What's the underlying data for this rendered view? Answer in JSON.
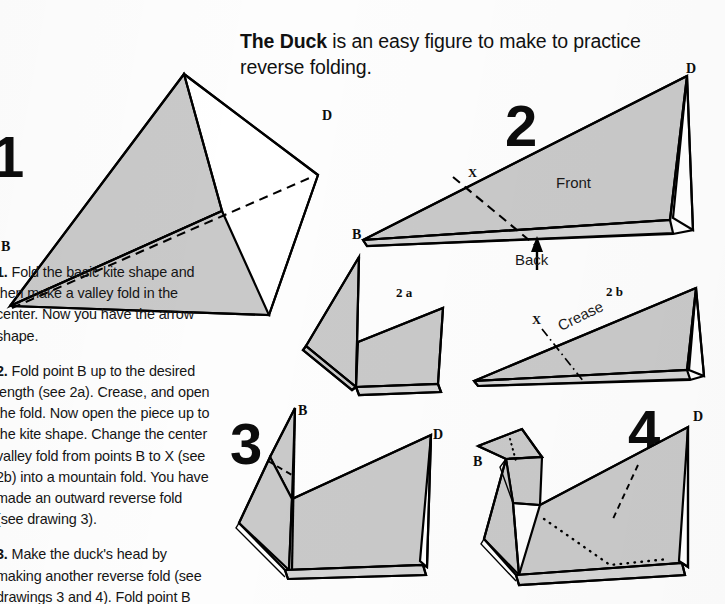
{
  "headline": {
    "bold_part": "The Duck",
    "rest": " is an easy figure to make to practice reverse folding."
  },
  "instructions": [
    {
      "number": "1.",
      "text": " Fold the basic kite shape and then make a valley fold in the center. Now you have the arrow shape."
    },
    {
      "number": "2.",
      "text": " Fold point B up to the desired length (see 2a). Crease, and open the fold. Now open the piece up to the kite shape. Change the center valley fold from points B to X (see 2b) into a mountain fold. You have made an outward reverse fold (see drawing 3)."
    },
    {
      "number": "3.",
      "text": " Make the duck's head by making another reverse fold (see drawings 3 and 4). Fold point B"
    }
  ],
  "figures": {
    "fig1": {
      "number": "1",
      "labels": {
        "b": "B",
        "d": "D"
      }
    },
    "fig2": {
      "number": "2",
      "labels": {
        "b": "B",
        "d": "D",
        "x": "X"
      },
      "front": "Front",
      "back": "Back"
    },
    "fig2a": {
      "number": "2 a"
    },
    "fig2b": {
      "number": "2 b",
      "labels": {
        "x": "X"
      },
      "crease": "Crease"
    },
    "fig3": {
      "number": "3",
      "labels": {
        "b": "B",
        "d": "D"
      }
    },
    "fig4": {
      "number": "4",
      "labels": {
        "b": "B",
        "d": "D"
      }
    }
  },
  "colors": {
    "paper_gray": "#c9c9c9",
    "paper_gray_light": "#d4d4d4",
    "ink": "#000000",
    "page_background": "#fdfdfd"
  }
}
